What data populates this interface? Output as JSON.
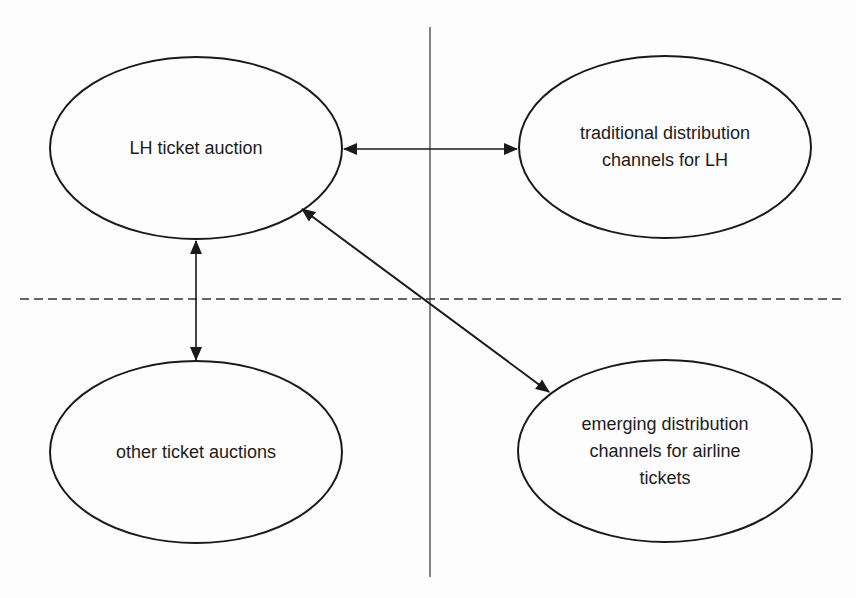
{
  "diagram": {
    "nodes": [
      {
        "id": "lh-auction",
        "label": "LH ticket auction",
        "quadrant": "top-left"
      },
      {
        "id": "traditional",
        "label": "traditional distribution channels for LH",
        "line1": "traditional distribution",
        "line2": "channels for LH",
        "quadrant": "top-right"
      },
      {
        "id": "other-auctions",
        "label": "other ticket auctions",
        "quadrant": "bottom-left"
      },
      {
        "id": "emerging",
        "label": "emerging distribution channels for airline tickets",
        "line1": "emerging distribution",
        "line2": "channels for airline",
        "line3": "tickets",
        "quadrant": "bottom-right"
      }
    ],
    "edges": [
      {
        "from": "lh-auction",
        "to": "traditional",
        "type": "bidirectional"
      },
      {
        "from": "lh-auction",
        "to": "other-auctions",
        "type": "bidirectional"
      },
      {
        "from": "lh-auction",
        "to": "emerging",
        "type": "bidirectional"
      }
    ],
    "dividers": {
      "vertical": "solid",
      "horizontal": "dashed"
    }
  }
}
